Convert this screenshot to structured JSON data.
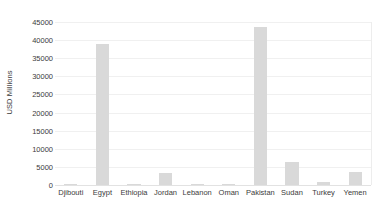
{
  "chart_data": {
    "type": "bar",
    "title": "",
    "xlabel": "",
    "ylabel": "USD Millions",
    "ylim": [
      0,
      45000
    ],
    "ytick_step": 5000,
    "yticks": [
      "0",
      "5000",
      "10000",
      "15000",
      "20000",
      "25000",
      "30000",
      "35000",
      "40000",
      "45000"
    ],
    "ytick_values": [
      0,
      5000,
      10000,
      15000,
      20000,
      25000,
      30000,
      35000,
      40000,
      45000
    ],
    "grid": true,
    "legend": "none",
    "bar_color": "#d9d9d9",
    "gridline_color": "#f0f0f0",
    "axis_color": "#e2e2e2",
    "text_color": "#3b3b3b",
    "categories": [
      "Djibouti",
      "Egypt",
      "Ethiopia",
      "Jordan",
      "Lebanon",
      "Oman",
      "Pakistan",
      "Sudan",
      "Turkey",
      "Yemen"
    ],
    "values": [
      300,
      39000,
      400,
      3400,
      150,
      250,
      43500,
      6300,
      700,
      3600
    ]
  }
}
